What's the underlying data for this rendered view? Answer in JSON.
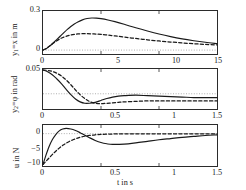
{
  "figure": {
    "xlabel": "t in s",
    "line_styles": {
      "solid": "solid",
      "dashed": "dashed",
      "reference": "dotted"
    },
    "colors": {
      "curve": "#1a1a1a",
      "frame": "#2b2b2b",
      "reference": "#9a9a9a"
    }
  },
  "chart_data": [
    {
      "type": "line",
      "panel": "top",
      "title": "",
      "xlabel": "",
      "ylabel": "y_1 = x in m",
      "ylabel_parts": {
        "symbol": "y",
        "subscript": "1",
        "equals": "=x",
        "unit": "in m"
      },
      "xlim": [
        0,
        15
      ],
      "ylim": [
        -0.03,
        0.3
      ],
      "xticks": [
        0,
        5,
        10,
        15
      ],
      "xticklabels": [
        "0",
        "5",
        "10",
        "15"
      ],
      "yticks": [
        0,
        0.3
      ],
      "yticklabels": [
        "0",
        "0.3"
      ],
      "grid": false,
      "reference_line": 0,
      "series": [
        {
          "name": "solid",
          "style": "solid",
          "x": [
            0,
            0.3,
            0.6,
            0.9,
            1.2,
            1.5,
            1.8,
            2.1,
            2.4,
            2.7,
            3.0,
            3.4,
            3.8,
            4.2,
            4.6,
            5.0,
            5.6,
            6.2,
            7.0,
            8.0,
            9.0,
            10.0,
            11.0,
            12.0,
            13.0,
            14.0,
            15.0
          ],
          "y": [
            0.0,
            0.012,
            0.032,
            0.056,
            0.082,
            0.108,
            0.134,
            0.159,
            0.181,
            0.2,
            0.216,
            0.232,
            0.242,
            0.246,
            0.245,
            0.241,
            0.231,
            0.218,
            0.198,
            0.171,
            0.146,
            0.123,
            0.103,
            0.086,
            0.072,
            0.06,
            0.05
          ]
        },
        {
          "name": "dashed",
          "style": "dashed",
          "x": [
            0,
            0.3,
            0.6,
            0.9,
            1.2,
            1.5,
            1.8,
            2.1,
            2.4,
            2.7,
            3.0,
            3.4,
            3.8,
            4.2,
            4.6,
            5.0,
            5.6,
            6.2,
            7.0,
            8.0,
            9.0,
            10.0,
            11.0,
            12.0,
            13.0,
            14.0,
            15.0
          ],
          "y": [
            0.0,
            0.013,
            0.033,
            0.054,
            0.072,
            0.088,
            0.1,
            0.109,
            0.116,
            0.121,
            0.124,
            0.126,
            0.126,
            0.125,
            0.123,
            0.12,
            0.115,
            0.109,
            0.1,
            0.089,
            0.079,
            0.07,
            0.062,
            0.055,
            0.049,
            0.044,
            0.04
          ]
        }
      ]
    },
    {
      "type": "line",
      "panel": "middle",
      "title": "",
      "xlabel": "",
      "ylabel": "y_2 = phi in rad",
      "ylabel_parts": {
        "symbol": "y",
        "subscript": "2",
        "equals": "=φ",
        "unit": "in rad"
      },
      "xlim": [
        0,
        1.5
      ],
      "ylim": [
        -0.032,
        0.052
      ],
      "xticks": [
        0,
        0.5,
        1,
        1.5
      ],
      "xticklabels": [
        "0",
        "0.5",
        "1",
        "1.5"
      ],
      "yticks": [
        0.05
      ],
      "yticklabels": [
        "0.05"
      ],
      "grid": false,
      "reference_line": 0,
      "series": [
        {
          "name": "solid",
          "style": "solid",
          "x": [
            0,
            0.04,
            0.08,
            0.12,
            0.16,
            0.2,
            0.24,
            0.28,
            0.32,
            0.36,
            0.4,
            0.45,
            0.5,
            0.55,
            0.6,
            0.65,
            0.7,
            0.8,
            0.9,
            1.0,
            1.1,
            1.2,
            1.3,
            1.4,
            1.5
          ],
          "y": [
            0.05,
            0.046,
            0.04,
            0.031,
            0.021,
            0.009,
            -0.002,
            -0.011,
            -0.017,
            -0.02,
            -0.02,
            -0.018,
            -0.014,
            -0.01,
            -0.007,
            -0.005,
            -0.004,
            -0.003,
            -0.004,
            -0.005,
            -0.006,
            -0.007,
            -0.008,
            -0.008,
            -0.008
          ]
        },
        {
          "name": "dashed",
          "style": "dashed",
          "x": [
            0,
            0.04,
            0.08,
            0.12,
            0.16,
            0.2,
            0.24,
            0.28,
            0.32,
            0.36,
            0.4,
            0.45,
            0.5,
            0.55,
            0.6,
            0.65,
            0.7,
            0.8,
            0.9,
            1.0,
            1.1,
            1.2,
            1.3,
            1.4,
            1.5
          ],
          "y": [
            0.05,
            0.049,
            0.047,
            0.043,
            0.037,
            0.029,
            0.019,
            0.008,
            -0.002,
            -0.01,
            -0.016,
            -0.02,
            -0.021,
            -0.02,
            -0.019,
            -0.018,
            -0.017,
            -0.016,
            -0.015,
            -0.015,
            -0.015,
            -0.015,
            -0.015,
            -0.015,
            -0.015
          ]
        }
      ]
    },
    {
      "type": "line",
      "panel": "bottom",
      "title": "",
      "xlabel": "t in s",
      "ylabel": "u in N",
      "ylabel_parts": {
        "symbol": "u",
        "subscript": "",
        "equals": "",
        "unit": "in N"
      },
      "xlim": [
        0,
        1.5
      ],
      "ylim": [
        -10.5,
        2.8
      ],
      "xticks": [
        0,
        0.5,
        1,
        1.5
      ],
      "xticklabels": [
        "0",
        "0.5",
        "1",
        "1.5"
      ],
      "yticks": [
        0,
        -5,
        -10
      ],
      "yticklabels": [
        "0",
        "−5",
        "−10"
      ],
      "grid": false,
      "reference_line": 0,
      "series": [
        {
          "name": "solid",
          "style": "solid",
          "x": [
            0,
            0.02,
            0.05,
            0.08,
            0.11,
            0.14,
            0.17,
            0.2,
            0.24,
            0.28,
            0.32,
            0.36,
            0.4,
            0.45,
            0.5,
            0.55,
            0.6,
            0.7,
            0.8,
            0.9,
            1.0,
            1.1,
            1.2,
            1.3,
            1.4,
            1.5
          ],
          "y": [
            -10.0,
            -7.6,
            -4.4,
            -2.0,
            -0.3,
            0.9,
            1.5,
            1.7,
            1.5,
            1.0,
            0.3,
            -0.5,
            -1.3,
            -2.2,
            -2.9,
            -3.3,
            -3.5,
            -3.4,
            -3.0,
            -2.5,
            -2.0,
            -1.6,
            -1.2,
            -0.9,
            -0.6,
            -0.4
          ]
        },
        {
          "name": "dashed",
          "style": "dashed",
          "x": [
            0,
            0.02,
            0.05,
            0.08,
            0.11,
            0.14,
            0.17,
            0.2,
            0.24,
            0.28,
            0.32,
            0.36,
            0.4,
            0.45,
            0.5,
            0.6,
            0.7,
            0.8,
            0.9,
            1.0,
            1.1,
            1.2,
            1.3,
            1.4,
            1.5
          ],
          "y": [
            -10.0,
            -9.2,
            -8.0,
            -6.8,
            -5.7,
            -4.7,
            -3.8,
            -3.1,
            -2.3,
            -1.7,
            -1.2,
            -0.85,
            -0.6,
            -0.38,
            -0.25,
            -0.12,
            -0.07,
            -0.05,
            -0.04,
            -0.04,
            -0.04,
            -0.04,
            -0.04,
            -0.04,
            -0.04
          ]
        }
      ]
    }
  ]
}
